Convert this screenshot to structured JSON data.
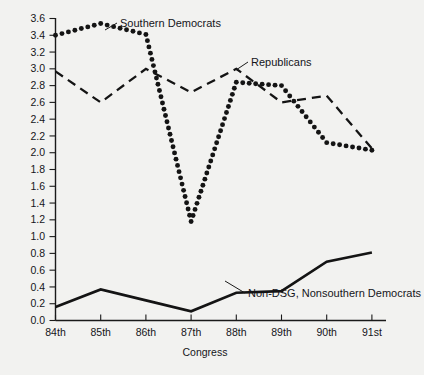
{
  "chart_data": {
    "type": "line",
    "title": "",
    "xlabel": "Congress",
    "ylabel": "",
    "categories": [
      "84th",
      "85th",
      "86th",
      "87th",
      "88th",
      "89th",
      "90th",
      "91st"
    ],
    "xlim": [
      0,
      7
    ],
    "ylim": [
      0.0,
      3.6
    ],
    "yticks": [
      "0.0",
      "0.2",
      "0.4",
      "0.6",
      "0.8",
      "1.0",
      "1.2",
      "1.4",
      "1.6",
      "1.8",
      "2.0",
      "2.2",
      "2.4",
      "2.6",
      "2.8",
      "3.0",
      "3.2",
      "3.4",
      "3.6"
    ],
    "ytick_values": [
      0.0,
      0.2,
      0.4,
      0.6,
      0.8,
      1.0,
      1.2,
      1.4,
      1.6,
      1.8,
      2.0,
      2.2,
      2.4,
      2.6,
      2.8,
      3.0,
      3.2,
      3.4,
      3.6
    ],
    "grid": false,
    "legend_position": "inline-annotations",
    "series": [
      {
        "name": "Southern Democrats",
        "style": "dotted",
        "color": "#141414",
        "values": [
          3.4,
          3.54,
          3.41,
          1.18,
          2.84,
          2.8,
          2.12,
          2.03
        ],
        "label_anchor": {
          "x": 2.05,
          "y": 3.47
        }
      },
      {
        "name": "Republicans",
        "style": "dashed",
        "color": "#141414",
        "values": [
          2.97,
          2.6,
          3.0,
          2.72,
          3.0,
          2.6,
          2.68,
          2.05
        ],
        "label_anchor": {
          "x": 4.12,
          "y": 3.02
        }
      },
      {
        "name": "Non-DSG, Nonsouthern Democrats",
        "style": "solid",
        "color": "#141414",
        "values": [
          0.16,
          0.37,
          0.24,
          0.11,
          0.33,
          0.35,
          0.7,
          0.81
        ],
        "label_anchor": {
          "x": 4.08,
          "y": 0.33
        }
      }
    ],
    "annotations": [
      {
        "text": "Southern Democrats",
        "x": 120,
        "y": 27
      },
      {
        "text": "Republicans",
        "x": 251,
        "y": 66
      },
      {
        "text": "Non-DSG, Nonsouthern Democrats",
        "x": 248,
        "y": 296
      }
    ]
  },
  "axis": {
    "x_title": "Congress"
  }
}
